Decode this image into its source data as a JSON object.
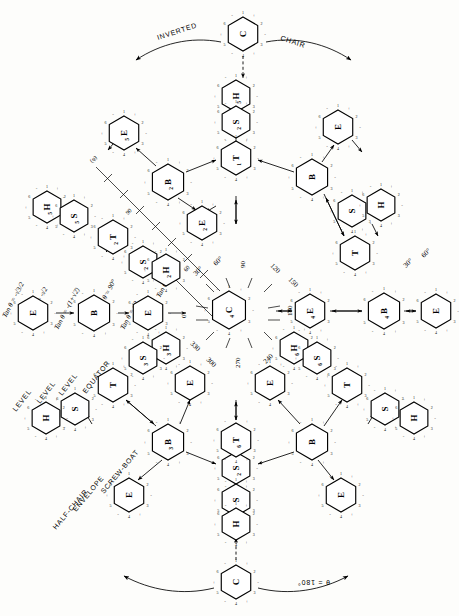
{
  "figure": {
    "center_label": "C",
    "center_sub": "4"
  },
  "outer_words": {
    "inverted": "INVERTED",
    "chair": "CHAIR",
    "theta180": "θ = 180°"
  },
  "region_words": [
    {
      "text": "LEVEL"
    },
    {
      "text": "LEVEL"
    },
    {
      "text": "LEVEL"
    },
    {
      "text": "EQUATOR"
    },
    {
      "text": "HALF-CHAIR"
    },
    {
      "text": "ENVELOPE"
    },
    {
      "text": "SCREW-BOAT"
    }
  ],
  "math_labels": [
    {
      "text": "Tan θ = -√3/2"
    },
    {
      "text": "Tan θ = -√2"
    },
    {
      "text": "Tan θ = -(1+√2)"
    },
    {
      "text": "Tan θ = √2"
    },
    {
      "text": "Tan θ = 1+√2"
    },
    {
      "text": "θ = 90°"
    }
  ],
  "phi_axis": {
    "label": "(φ)",
    "ticks": [
      "90",
      "60",
      "30"
    ],
    "end_labels": [
      "30°",
      "60°"
    ]
  },
  "radial_angles": [
    {
      "value": "30°"
    },
    {
      "value": "60°"
    },
    {
      "value": "90"
    },
    {
      "value": "120"
    },
    {
      "value": "150"
    },
    {
      "value": "180"
    },
    {
      "value": "210"
    },
    {
      "value": "240"
    },
    {
      "value": "270"
    },
    {
      "value": "300"
    },
    {
      "value": "330"
    },
    {
      "value": "0"
    }
  ],
  "conformers": [
    {
      "id": "c-top",
      "label": "C",
      "sub": "",
      "x": 243,
      "y": 34,
      "r": 17,
      "rot": 0,
      "name": "chair-top"
    },
    {
      "id": "h5-top",
      "label": "H",
      "sub": "5",
      "x": 236,
      "y": 96,
      "r": 16,
      "rot": 0,
      "name": "half-chair-h5"
    },
    {
      "id": "s2-top",
      "label": "S",
      "sub": "2",
      "x": 236,
      "y": 122,
      "r": 16,
      "rot": 0,
      "name": "skew-boat-s2"
    },
    {
      "id": "t1-top",
      "label": "T",
      "sub": "1",
      "x": 236,
      "y": 158,
      "r": 17,
      "rot": 0,
      "name": "twist-t1"
    },
    {
      "id": "e5-ul",
      "label": "E",
      "sub": "5",
      "x": 124,
      "y": 133,
      "r": 17,
      "rot": 0,
      "name": "envelope-e5"
    },
    {
      "id": "b2-ul",
      "label": "B",
      "sub": "2",
      "x": 168,
      "y": 182,
      "r": 18,
      "rot": 0,
      "name": "boat-b2"
    },
    {
      "id": "e2-ul",
      "label": "E",
      "sub": "2",
      "x": 202,
      "y": 223,
      "r": 17,
      "rot": 0,
      "name": "envelope-e2"
    },
    {
      "id": "e-ur",
      "label": "E",
      "sub": "",
      "x": 338,
      "y": 127,
      "r": 17,
      "rot": 0,
      "name": "envelope-upper-right"
    },
    {
      "id": "b-ur",
      "label": "B",
      "sub": "",
      "x": 312,
      "y": 177,
      "r": 18,
      "rot": 0,
      "name": "boat-upper-right"
    },
    {
      "id": "s-ur",
      "label": "S",
      "sub": "",
      "x": 352,
      "y": 211,
      "r": 16,
      "rot": 0,
      "name": "skew-boat-upper-right"
    },
    {
      "id": "h-ur",
      "label": "H",
      "sub": "",
      "x": 381,
      "y": 205,
      "r": 16,
      "rot": 0,
      "name": "half-chair-upper-right"
    },
    {
      "id": "t-ur",
      "label": "T",
      "sub": "",
      "x": 355,
      "y": 253,
      "r": 17,
      "rot": 0,
      "name": "twist-upper-right"
    },
    {
      "id": "h5-ul",
      "label": "H",
      "sub": "5",
      "x": 47,
      "y": 207,
      "r": 16,
      "rot": 0,
      "name": "half-chair-left"
    },
    {
      "id": "s5-ul",
      "label": "S",
      "sub": "5",
      "x": 74,
      "y": 216,
      "r": 16,
      "rot": 0,
      "name": "skew-boat-left"
    },
    {
      "id": "t2-ul",
      "label": "T",
      "sub": "2",
      "x": 113,
      "y": 237,
      "r": 17,
      "rot": 0,
      "name": "twist-left"
    },
    {
      "id": "s2-ml",
      "label": "S",
      "sub": "2",
      "x": 143,
      "y": 262,
      "r": 16,
      "rot": 0,
      "name": "skew-boat-mid-left"
    },
    {
      "id": "h2-ml",
      "label": "H",
      "sub": "2",
      "x": 166,
      "y": 270,
      "r": 16,
      "rot": 0,
      "name": "half-chair-mid-left"
    },
    {
      "id": "e-far-left",
      "label": "E",
      "sub": "",
      "x": 33,
      "y": 313,
      "r": 17,
      "rot": 0,
      "name": "envelope-far-left"
    },
    {
      "id": "b-left",
      "label": "B",
      "sub": "",
      "x": 94,
      "y": 313,
      "r": 18,
      "rot": 0,
      "name": "boat-left"
    },
    {
      "id": "e-left",
      "label": "E",
      "sub": "",
      "x": 148,
      "y": 313,
      "r": 17,
      "rot": 0,
      "name": "envelope-left"
    },
    {
      "id": "c4",
      "label": "C",
      "sub": "4",
      "x": 229,
      "y": 310,
      "r": 19,
      "rot": 0,
      "name": "chair-center"
    },
    {
      "id": "e-right",
      "label": "E",
      "sub": "4",
      "x": 310,
      "y": 311,
      "r": 17,
      "rot": 0,
      "name": "envelope-right"
    },
    {
      "id": "b4-right",
      "label": "B",
      "sub": "4",
      "x": 384,
      "y": 311,
      "r": 18,
      "rot": 0,
      "name": "boat-right"
    },
    {
      "id": "e-far-right",
      "label": "E",
      "sub": "",
      "x": 436,
      "y": 311,
      "r": 17,
      "rot": 0,
      "name": "envelope-far-right"
    },
    {
      "id": "h3-lc",
      "label": "H",
      "sub": "3",
      "x": 166,
      "y": 348,
      "r": 16,
      "rot": 0,
      "name": "half-chair-lower-center"
    },
    {
      "id": "s3-lc",
      "label": "S",
      "sub": "3",
      "x": 143,
      "y": 358,
      "r": 16,
      "rot": 0,
      "name": "skew-boat-lower-center"
    },
    {
      "id": "h6-rc",
      "label": "H",
      "sub": "6",
      "x": 294,
      "y": 348,
      "r": 16,
      "rot": 0,
      "name": "half-chair-right-center"
    },
    {
      "id": "s6-rc",
      "label": "S",
      "sub": "6",
      "x": 317,
      "y": 358,
      "r": 16,
      "rot": 0,
      "name": "skew-boat-right-center"
    },
    {
      "id": "e-ll",
      "label": "E",
      "sub": "",
      "x": 190,
      "y": 383,
      "r": 17,
      "rot": 0,
      "name": "envelope-lower-left"
    },
    {
      "id": "t-ll",
      "label": "T",
      "sub": "",
      "x": 113,
      "y": 385,
      "r": 17,
      "rot": 0,
      "name": "twist-lower-left"
    },
    {
      "id": "e-lr",
      "label": "E",
      "sub": "",
      "x": 270,
      "y": 383,
      "r": 17,
      "rot": 0,
      "name": "envelope-lower-right"
    },
    {
      "id": "t-lr",
      "label": "T",
      "sub": "",
      "x": 347,
      "y": 385,
      "r": 17,
      "rot": 0,
      "name": "twist-lower-right"
    },
    {
      "id": "s-ll2",
      "label": "S",
      "sub": "",
      "x": 75,
      "y": 409,
      "r": 16,
      "rot": 0,
      "name": "skew-boat-lower-left"
    },
    {
      "id": "h-ll2",
      "label": "H",
      "sub": "",
      "x": 46,
      "y": 418,
      "r": 16,
      "rot": 0,
      "name": "half-chair-lower-left"
    },
    {
      "id": "s-lr2",
      "label": "S",
      "sub": "",
      "x": 385,
      "y": 409,
      "r": 16,
      "rot": 0,
      "name": "skew-boat-lower-right"
    },
    {
      "id": "h-lr2",
      "label": "H",
      "sub": "",
      "x": 414,
      "y": 418,
      "r": 16,
      "rot": 0,
      "name": "half-chair-lower-right"
    },
    {
      "id": "b-lb",
      "label": "B",
      "sub": "3",
      "x": 168,
      "y": 442,
      "r": 18,
      "rot": 0,
      "name": "boat-lower-left"
    },
    {
      "id": "b-rb",
      "label": "B",
      "sub": "",
      "x": 312,
      "y": 442,
      "r": 18,
      "rot": 0,
      "name": "boat-lower-right"
    },
    {
      "id": "e-bl",
      "label": "E",
      "sub": "",
      "x": 129,
      "y": 495,
      "r": 17,
      "rot": 0,
      "name": "envelope-bottom-left"
    },
    {
      "id": "e-br",
      "label": "E",
      "sub": "",
      "x": 341,
      "y": 495,
      "r": 17,
      "rot": 0,
      "name": "envelope-bottom-right"
    },
    {
      "id": "s2-bot",
      "label": "S",
      "sub": "2",
      "x": 236,
      "y": 468,
      "r": 16,
      "rot": 0,
      "name": "skew-boat-bottom"
    },
    {
      "id": "t6-bot",
      "label": "T",
      "sub": "6",
      "x": 236,
      "y": 440,
      "r": 17,
      "rot": 0,
      "name": "twist-bottom"
    },
    {
      "id": "s-bot2",
      "label": "S",
      "sub": "",
      "x": 236,
      "y": 500,
      "r": 16,
      "rot": 0,
      "name": "skew-boat-bottom-2"
    },
    {
      "id": "h-bot2",
      "label": "H",
      "sub": "",
      "x": 236,
      "y": 524,
      "r": 16,
      "rot": 0,
      "name": "half-chair-bottom"
    },
    {
      "id": "c-bot",
      "label": "C",
      "sub": "",
      "x": 236,
      "y": 582,
      "r": 17,
      "rot": 0,
      "name": "chair-bottom"
    }
  ],
  "vertex_numbers": [
    "1",
    "2",
    "3",
    "4",
    "5",
    "6"
  ],
  "vertex_signs": [
    "+",
    "-",
    "+",
    "-",
    "+",
    "-"
  ],
  "colors": {
    "ink": "#000000",
    "paper": "#fdfdfb"
  }
}
